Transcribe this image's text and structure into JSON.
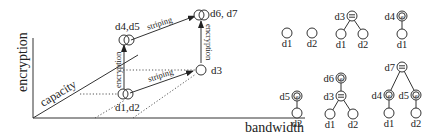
{
  "left_diagram": {
    "axes": {
      "y_label": "encryption",
      "x_label": "bandwidth",
      "diagonal_label": "capacity"
    },
    "nodes": [
      {
        "id": "d1d2",
        "label": "d1,d2"
      },
      {
        "id": "d4d5",
        "label": "d4,d5"
      },
      {
        "id": "d3",
        "label": "d3"
      },
      {
        "id": "d6d7",
        "label": "d6, d7"
      }
    ],
    "edges": [
      {
        "from": "d1d2",
        "to": "d4d5",
        "label": "encryption"
      },
      {
        "from": "d1d2",
        "to": "d3",
        "label": "striping"
      },
      {
        "from": "d4d5",
        "to": "d6d7",
        "label": "striping"
      },
      {
        "from": "d3",
        "to": "d6d7",
        "label": "encryption"
      }
    ]
  },
  "trees": [
    {
      "id": "t-d1",
      "root": "d1",
      "root_op": "none",
      "children": []
    },
    {
      "id": "t-d2",
      "root": "d2",
      "root_op": "none",
      "children": []
    },
    {
      "id": "t-d3",
      "root": "d3",
      "root_op": "striping",
      "children": [
        "d1",
        "d2"
      ]
    },
    {
      "id": "t-d4",
      "root": "d4",
      "root_op": "encryption",
      "children": [
        "d1"
      ]
    },
    {
      "id": "t-d5",
      "root": "d5",
      "root_op": "encryption",
      "children": [
        "d2"
      ]
    },
    {
      "id": "t-d6",
      "root": "d6",
      "root_op": "encryption",
      "children": [
        "d3"
      ],
      "grandchildren": [
        "d1",
        "d2"
      ]
    },
    {
      "id": "t-d7",
      "root": "d7",
      "root_op": "striping",
      "children": [
        "d4",
        "d5"
      ],
      "grandchildren": [
        "d1",
        "d2"
      ]
    }
  ],
  "symbols": {
    "encryption": "e",
    "striping": "="
  }
}
